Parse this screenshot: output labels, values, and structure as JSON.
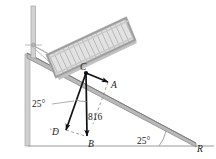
{
  "figure": {
    "name": "crate-on-incline-force-diagram",
    "background_color": "#ffffff",
    "labels": {
      "point_c": "C",
      "point_a": "A",
      "point_b": "B",
      "point_d": "D",
      "point_r": "R",
      "force_magnitude": "816",
      "angle_incline": "25°",
      "angle_cable": "25°"
    },
    "colors": {
      "vector_stroke": "#111111",
      "incline_fill": "#b9b9b9",
      "incline_stroke": "#8c8c8c",
      "crate_fill": "#dcdcdc",
      "crate_stroke": "#a0a0a0",
      "crate_frame": "#c9c9c9",
      "wall_fill": "#cfcfcf",
      "pole_fill": "#d2d2d2",
      "cable_stroke": "#a8a8a8",
      "ground_stroke": "#9a9a9a",
      "dashed_stroke": "#8a8a8a",
      "arc_stroke": "#8a8a8a"
    },
    "geometry": {
      "incline_angle_deg": 25,
      "point_c": [
        86,
        73
      ],
      "point_a": [
        108,
        82
      ],
      "point_b": [
        87,
        136
      ],
      "point_d": [
        66,
        130
      ],
      "point_r": [
        193,
        143
      ]
    }
  }
}
